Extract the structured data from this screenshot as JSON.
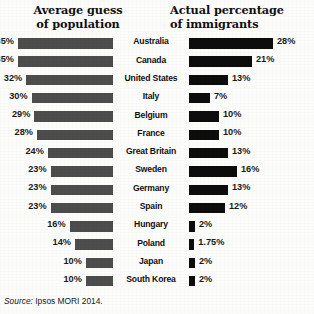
{
  "headers": {
    "left": {
      "line1": "Average guess",
      "line2": "of population"
    },
    "right": {
      "line1": "Actual percentage",
      "line2": "of immigrants"
    }
  },
  "source": {
    "label": "Source:",
    "text": "Ipsos MORI 2014."
  },
  "colors": {
    "guess_bar": "#4d4d4d",
    "actual_bar": "#0d0d0d",
    "background": "#fcfcfb",
    "text": "#111111"
  },
  "chart_data": {
    "type": "bar",
    "xlabel": "",
    "ylabel": "",
    "orientation": "horizontal",
    "grid": false,
    "legend_position": "none",
    "categories": [
      "Australia",
      "Canada",
      "United States",
      "Italy",
      "Belgium",
      "France",
      "Great Britain",
      "Sweden",
      "Germany",
      "Spain",
      "Hungary",
      "Poland",
      "Japan",
      "South Korea"
    ],
    "series": [
      {
        "name": "Average guess of population",
        "values": [
          35,
          35,
          32,
          30,
          29,
          28,
          24,
          23,
          23,
          23,
          16,
          14,
          10,
          10
        ],
        "labels": [
          "35%",
          "35%",
          "32%",
          "30%",
          "29%",
          "28%",
          "24%",
          "23%",
          "23%",
          "23%",
          "16%",
          "14%",
          "10%",
          "10%"
        ]
      },
      {
        "name": "Actual percentage of immigrants",
        "values": [
          28,
          21,
          13,
          7,
          10,
          10,
          13,
          16,
          13,
          12,
          2,
          1.75,
          2,
          2
        ],
        "labels": [
          "28%",
          "21%",
          "13%",
          "7%",
          "10%",
          "10%",
          "13%",
          "16%",
          "13%",
          "12%",
          "2%",
          "1.75%",
          "2%",
          "2%"
        ]
      }
    ],
    "xlim": [
      0,
      35
    ]
  }
}
